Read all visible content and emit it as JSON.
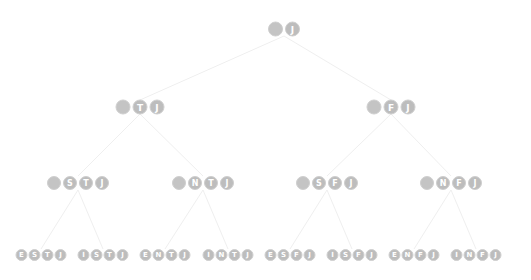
{
  "diagram": {
    "type": "tree",
    "circle_color": "#bdbdbd",
    "edge_color": "#eeeeee",
    "root": {
      "label": "J",
      "letters": [
        "",
        "J"
      ]
    },
    "level1": [
      {
        "label": "TJ",
        "letters": [
          "",
          "T",
          "J"
        ]
      },
      {
        "label": "FJ",
        "letters": [
          "",
          "F",
          "J"
        ]
      }
    ],
    "level2": [
      {
        "label": "STJ",
        "letters": [
          "",
          "S",
          "T",
          "J"
        ]
      },
      {
        "label": "NTJ",
        "letters": [
          "",
          "N",
          "T",
          "J"
        ]
      },
      {
        "label": "SFJ",
        "letters": [
          "",
          "S",
          "F",
          "J"
        ]
      },
      {
        "label": "NFJ",
        "letters": [
          "",
          "N",
          "F",
          "J"
        ]
      }
    ],
    "leaves": [
      {
        "label": "ESTJ",
        "letters": [
          "E",
          "S",
          "T",
          "J"
        ]
      },
      {
        "label": "ISTJ",
        "letters": [
          "I",
          "S",
          "T",
          "J"
        ]
      },
      {
        "label": "ENTJ",
        "letters": [
          "E",
          "N",
          "T",
          "J"
        ]
      },
      {
        "label": "INTJ",
        "letters": [
          "I",
          "N",
          "T",
          "J"
        ]
      },
      {
        "label": "ESFJ",
        "letters": [
          "E",
          "S",
          "F",
          "J"
        ]
      },
      {
        "label": "ISFJ",
        "letters": [
          "I",
          "S",
          "F",
          "J"
        ]
      },
      {
        "label": "ENFJ",
        "letters": [
          "E",
          "N",
          "F",
          "J"
        ]
      },
      {
        "label": "INFJ",
        "letters": [
          "I",
          "N",
          "F",
          "J"
        ]
      }
    ]
  }
}
